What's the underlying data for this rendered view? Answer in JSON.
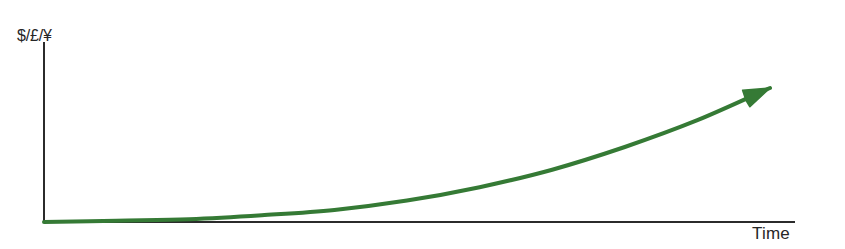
{
  "figure": {
    "background_color": "#ffffff",
    "width": 845,
    "height": 249
  },
  "axes": {
    "y_label": "$/£/¥",
    "x_label": "Time",
    "axis_color": "#2b2b2b",
    "axis_width": 2,
    "origin": [
      44,
      222
    ],
    "y_axis_top": [
      44,
      42
    ],
    "x_axis_right": [
      795,
      222
    ]
  },
  "curve": {
    "color": "#357a35",
    "stroke_width": 4,
    "has_arrowhead": true,
    "arrow_tip": [
      770,
      88
    ]
  },
  "chart_data": {
    "type": "line",
    "title": "",
    "subtitle": "",
    "xlabel": "Time",
    "ylabel": "$/£/¥",
    "grid": false,
    "legend": false,
    "xlim": [
      0,
      1
    ],
    "ylim": [
      0,
      1
    ],
    "annotations": [
      "Arrowhead at end of curve indicating continued upward growth"
    ],
    "series": [
      {
        "name": "Exponential growth",
        "color": "#357a35",
        "x": [
          0.0,
          0.1,
          0.2,
          0.3,
          0.4,
          0.5,
          0.6,
          0.7,
          0.8,
          0.9,
          1.0
        ],
        "y": [
          0.0,
          0.01,
          0.02,
          0.05,
          0.09,
          0.16,
          0.26,
          0.39,
          0.56,
          0.76,
          1.0
        ]
      }
    ]
  }
}
